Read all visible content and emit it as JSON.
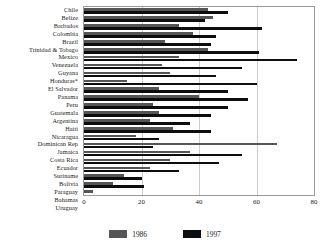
{
  "chart_data": {
    "type": "bar",
    "orientation": "horizontal",
    "title": "",
    "subtitle": "",
    "xlabel": "",
    "ylabel": "",
    "xlim": [
      0,
      80
    ],
    "xticks": [
      0,
      20,
      40,
      60,
      80
    ],
    "xtick_labels": [
      "0",
      "20",
      "40",
      "60",
      "80"
    ],
    "grid": true,
    "grid_axis": "x",
    "legend_position": "bottom",
    "categories": [
      "Chile",
      "Belize",
      "Barbados",
      "Colombia",
      "Brazil",
      "Trinidad & Tobago",
      "Mexico",
      "Venezuela",
      "Guyana",
      "Honduras*",
      "El Salvador",
      "Panama",
      "Peru",
      "Guatemala",
      "Argentina",
      "Haiti",
      "Nicaragua",
      "Dominican Rep",
      "Jamaica",
      "Costa Rica",
      "Ecuador",
      "Suriname",
      "Bolivia",
      "Paraguay",
      "Bahamas",
      "Uruguay"
    ],
    "series": [
      {
        "name": "1986",
        "color": "#555555",
        "values": [
          43,
          45,
          33,
          38,
          28,
          43,
          33,
          27,
          30,
          15,
          26,
          40,
          24,
          26,
          23,
          31,
          18,
          67,
          37,
          30,
          23,
          14,
          10,
          3,
          1,
          1
        ]
      },
      {
        "name": "1997",
        "color": "#0d0d0d",
        "values": [
          50,
          42,
          62,
          46,
          44,
          61,
          74,
          55,
          46,
          60,
          50,
          57,
          50,
          44,
          37,
          44,
          26,
          24,
          55,
          47,
          33,
          20,
          21,
          0,
          0,
          0
        ]
      }
    ]
  },
  "legend": {
    "entries": [
      {
        "label": "1986",
        "color": "#555555"
      },
      {
        "label": "1997",
        "color": "#0d0d0d"
      }
    ]
  },
  "colors": {
    "series_1986": "#555555",
    "series_1997": "#0d0d0d",
    "gridline": "#cccccc",
    "axis_frame": "#9a9a9a",
    "text": "#1a1a1a",
    "background": "#ffffff"
  }
}
